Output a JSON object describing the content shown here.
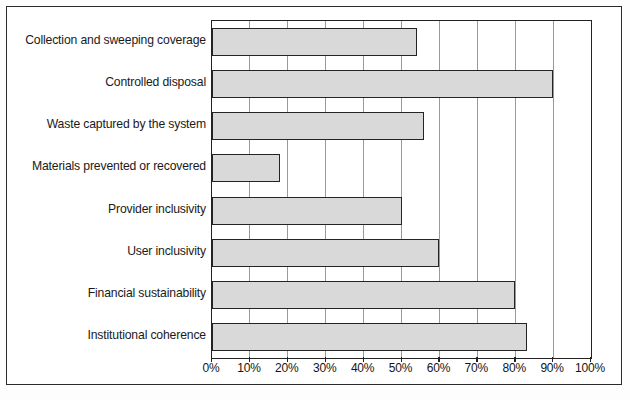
{
  "figure": {
    "frame_color": "#2b2b2b",
    "background": "#ffffff"
  },
  "chart_data": {
    "type": "bar",
    "orientation": "horizontal",
    "title": "",
    "xlabel": "",
    "ylabel": "",
    "xlim": [
      0,
      100
    ],
    "grid": true,
    "legend": "none",
    "bar_fill_color": "#d9d9d9",
    "bar_edge_color": "#242424",
    "axis_color": "#222222",
    "gridline_color": "#9a9a9a",
    "categories": [
      "Collection and sweeping coverage",
      "Controlled disposal",
      "Waste captured by the system",
      "Materials prevented or recovered",
      "Provider inclusivity",
      "User inclusivity",
      "Financial sustainability",
      "Institutional coherence"
    ],
    "values": [
      54,
      90,
      56,
      18,
      50,
      60,
      80,
      83
    ],
    "value_unit": "%",
    "tick_labels": [
      "0%",
      "10%",
      "20%",
      "30%",
      "40%",
      "50%",
      "60%",
      "70%",
      "80%",
      "90%",
      "100%"
    ],
    "tick_values": [
      0,
      10,
      20,
      30,
      40,
      50,
      60,
      70,
      80,
      90,
      100
    ]
  }
}
